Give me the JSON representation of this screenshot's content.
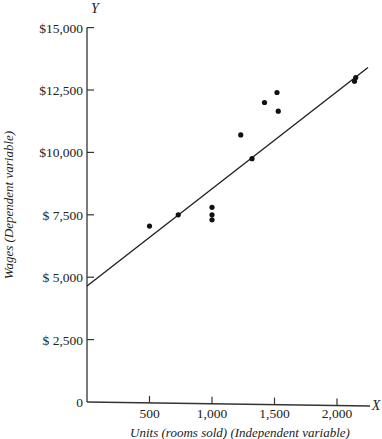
{
  "chart_data": {
    "type": "scatter",
    "title": "",
    "xlabel": "Units (rooms sold) (Independent variable)",
    "ylabel": "Wages (Dependent variable)",
    "x_axis_letter": "X",
    "y_axis_letter": "Y",
    "xlim": [
      0,
      2300
    ],
    "ylim": [
      0,
      15000
    ],
    "x_ticks": [
      500,
      1000,
      1500,
      2000
    ],
    "x_tick_labels": [
      "500",
      "1,000",
      "1,500",
      "2,000"
    ],
    "y_ticks": [
      0,
      2500,
      5000,
      7500,
      10000,
      12500,
      15000
    ],
    "y_tick_labels": [
      "0",
      "$ 2,500",
      "$ 5,000",
      "$ 7,500",
      "$10,000",
      "$12,500",
      "$15,000"
    ],
    "grid": false,
    "legend": null,
    "series": [
      {
        "name": "Observations",
        "type": "scatter",
        "points": [
          {
            "x": 500,
            "y": 7050
          },
          {
            "x": 730,
            "y": 7500
          },
          {
            "x": 1000,
            "y": 7800
          },
          {
            "x": 1000,
            "y": 7500
          },
          {
            "x": 1000,
            "y": 7300
          },
          {
            "x": 1230,
            "y": 10700
          },
          {
            "x": 1320,
            "y": 9750
          },
          {
            "x": 1420,
            "y": 12000
          },
          {
            "x": 1520,
            "y": 12400
          },
          {
            "x": 1530,
            "y": 11650
          },
          {
            "x": 2140,
            "y": 12850
          },
          {
            "x": 2150,
            "y": 13000
          }
        ]
      },
      {
        "name": "Regression line",
        "type": "line",
        "points": [
          {
            "x": 0,
            "y": 4650
          },
          {
            "x": 2200,
            "y": 13200
          }
        ]
      }
    ]
  }
}
